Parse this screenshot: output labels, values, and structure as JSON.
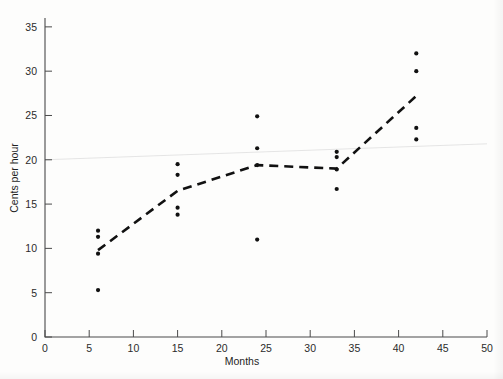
{
  "chart_data": {
    "type": "scatter",
    "title": "",
    "xlabel": "Months",
    "ylabel": "Cents per hour",
    "xlim": [
      0,
      50
    ],
    "ylim": [
      0,
      36
    ],
    "grid": false,
    "legend": "none",
    "xticks": [
      0,
      5,
      10,
      15,
      20,
      25,
      30,
      35,
      40,
      45,
      50
    ],
    "yticks": [
      0,
      5,
      10,
      15,
      20,
      25,
      30,
      35
    ],
    "xtick_labels": [
      "0",
      "5",
      "10",
      "15",
      "20",
      "25",
      "30",
      "35",
      "40",
      "45",
      "50"
    ],
    "ytick_labels": [
      "0",
      "5",
      "10",
      "15",
      "20",
      "25",
      "30",
      "35"
    ],
    "series": [
      {
        "name": "observations",
        "type": "scatter",
        "marker": "dot",
        "color": "#111111",
        "points": [
          {
            "x": 6,
            "y": 12.0
          },
          {
            "x": 6,
            "y": 11.3
          },
          {
            "x": 6,
            "y": 9.4
          },
          {
            "x": 6,
            "y": 5.3
          },
          {
            "x": 15,
            "y": 19.5
          },
          {
            "x": 15,
            "y": 18.3
          },
          {
            "x": 15,
            "y": 14.6
          },
          {
            "x": 15,
            "y": 13.8
          },
          {
            "x": 24,
            "y": 24.9
          },
          {
            "x": 24,
            "y": 21.3
          },
          {
            "x": 24,
            "y": 19.4
          },
          {
            "x": 24,
            "y": 11.0
          },
          {
            "x": 33,
            "y": 20.9
          },
          {
            "x": 33,
            "y": 20.3
          },
          {
            "x": 33,
            "y": 18.9
          },
          {
            "x": 33,
            "y": 16.7
          },
          {
            "x": 42,
            "y": 32.0
          },
          {
            "x": 42,
            "y": 30.0
          },
          {
            "x": 42,
            "y": 23.6
          },
          {
            "x": 42,
            "y": 22.3
          }
        ]
      },
      {
        "name": "trend-dashed",
        "type": "line",
        "style": "dashed",
        "color": "#111111",
        "points": [
          {
            "x": 6,
            "y": 9.8
          },
          {
            "x": 15,
            "y": 16.5
          },
          {
            "x": 24,
            "y": 19.4
          },
          {
            "x": 33,
            "y": 19.0
          },
          {
            "x": 42,
            "y": 27.2
          }
        ]
      },
      {
        "name": "reference-faint",
        "type": "line",
        "style": "solid-faint",
        "color": "#e2e2e2",
        "points": [
          {
            "x": 0,
            "y": 20.0
          },
          {
            "x": 50,
            "y": 21.8
          }
        ]
      }
    ]
  }
}
